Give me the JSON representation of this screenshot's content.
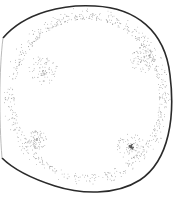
{
  "illustration": {
    "subject": "stippled round fruit",
    "outline_color": "#2a2a2a",
    "stipple_color": "#8a8a8a",
    "dark_spot_color": "#555555",
    "background": "#ffffff",
    "spots": [
      {
        "name": "upper-left-spot",
        "cx": 43,
        "cy": 70,
        "r": 15
      },
      {
        "name": "upper-right-spot",
        "cx": 143,
        "cy": 60,
        "r": 13
      },
      {
        "name": "lower-left-spot",
        "cx": 37,
        "cy": 140,
        "r": 10
      },
      {
        "name": "lower-right-spot",
        "cx": 131,
        "cy": 147,
        "r": 14,
        "dark_center": true
      }
    ]
  }
}
